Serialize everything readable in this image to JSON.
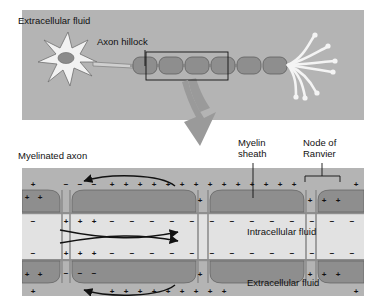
{
  "figure": {
    "title_top_panel": "Extracellular fluid",
    "kind": "neuron-myelination-saltatory-conduction-diagram"
  },
  "colors": {
    "page_background": "#ffffff",
    "panel_background": "#b4b4b4",
    "panel_background_light": "#c3c3c3",
    "myelin_fill": "#8e8e8e",
    "myelin_fill_dark": "#7b7b7b",
    "axoplasm_fill": "#e2e2e2",
    "soma_fill": "#f2f2f2",
    "nucleus_fill": "#8b8b8b",
    "ink": "#111111",
    "arrow_gray": "#9a9a9a",
    "terminal_fill": "#f4f4f4"
  },
  "top_panel": {
    "labels": [
      {
        "id": "extracellular-fluid",
        "text": "Extracellular fluid",
        "x": 18,
        "y": 24
      },
      {
        "id": "axon-hillock",
        "text": "Axon hillock",
        "x": 97,
        "y": 45
      }
    ],
    "parts": {
      "soma": "cell-body",
      "nucleus": "nucleus",
      "axon": "axon",
      "myelin_segment_count": 6,
      "axon_terminal_branches": 7,
      "inset_box": "magnified-region-selector"
    }
  },
  "connector": {
    "name": "magnification-arrow",
    "direction": "down"
  },
  "bottom_panel": {
    "labels": [
      {
        "id": "myelinated-axon",
        "text": "Myelinated axon",
        "x": 18,
        "y": 159
      },
      {
        "id": "myelin-sheath-l1",
        "text": "Myelin",
        "x": 238,
        "y": 146
      },
      {
        "id": "myelin-sheath-l2",
        "text": "sheath",
        "x": 238,
        "y": 157
      },
      {
        "id": "node-of-ranvier-l1",
        "text": "Node of",
        "x": 305,
        "y": 146
      },
      {
        "id": "node-of-ranvier-l2",
        "text": "Ranvier",
        "x": 305,
        "y": 157
      },
      {
        "id": "intracellular-fluid",
        "text": "Intracellular fluid",
        "x": 247,
        "y": 235
      },
      {
        "id": "extracellular-fluid-bottom",
        "text": "Extracellular fluid",
        "x": 247,
        "y": 286
      }
    ],
    "charges": {
      "outer_polarity_over_myelin": "+",
      "outer_polarity_at_active_node": "−",
      "inner_polarity_under_myelin": "−",
      "inner_polarity_at_active_node": "+"
    },
    "current_flow": {
      "extracellular_arrows": 2,
      "intracellular_arrows": 2,
      "description": "local-current-loops"
    },
    "node_count": 3,
    "myelin_segment_count": 3
  }
}
